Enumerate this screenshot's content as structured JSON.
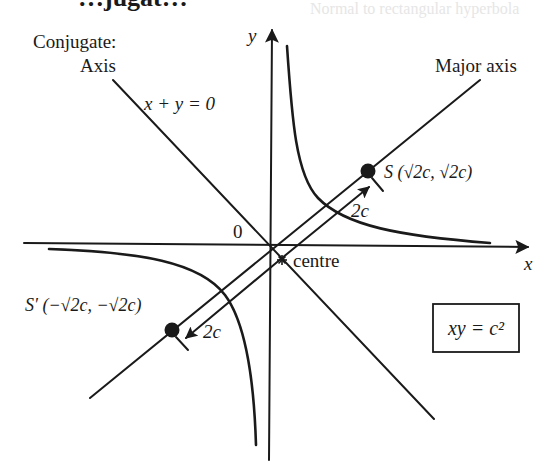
{
  "figure": {
    "title_fragment": "…jugat…",
    "bleed_text": "Normal to rectangular hyperbola",
    "labels": {
      "conjugate_axis_line1": "Conjugate:",
      "conjugate_axis_line2": "Axis",
      "conjugate_equation": "x + y = 0",
      "major_axis": "Major axis",
      "y_axis": "y",
      "x_axis": "x",
      "origin": "0",
      "centre": "centre",
      "focus_S": "S (√2c, √2c)",
      "focus_S_prime": "S′ (−√2c, −√2c)",
      "distance_upper": "2c",
      "distance_lower": "2c",
      "equation_box": "xy = c²"
    },
    "colors": {
      "ink": "#1a1a1a",
      "background": "#ffffff"
    }
  }
}
